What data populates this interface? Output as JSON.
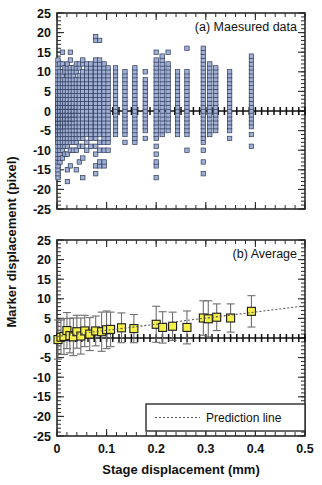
{
  "figure": {
    "axis_labels": {
      "y": "Marker displacement (pixel)",
      "x": "Stage displacement (mm)"
    }
  },
  "chart_data": [
    {
      "type": "scatter",
      "title": "(a) Maesured data",
      "panel": "a",
      "xlabel": "Stage displacement (mm)",
      "ylabel": "Marker displacement (pixel)",
      "xlim": [
        0,
        0.5
      ],
      "ylim": [
        -25,
        25
      ],
      "xticks": [
        0,
        0.1,
        0.2,
        0.3,
        0.4,
        0.5
      ],
      "xticklabels": [
        "0",
        "0.1",
        "0.2",
        "0.3",
        "0.4",
        "0.5"
      ],
      "yticks": [
        -25,
        -20,
        -15,
        -10,
        -5,
        0,
        5,
        10,
        15,
        20,
        25
      ],
      "yticklabels": [
        "-25",
        "-20",
        "-15",
        "-10",
        "-5",
        "0",
        "5",
        "10",
        "15",
        "20",
        "25"
      ],
      "grid": false,
      "legend": null,
      "marker_color": "#9fb0d4",
      "marker_edge_color": "#2e3a5c",
      "columns": [
        {
          "x": 0.002,
          "y": [
            -17,
            -16,
            -15,
            -14,
            -13,
            -12,
            -11,
            -10,
            -9,
            -8,
            -8,
            -7,
            -7,
            -6,
            -6,
            -5,
            -5,
            -5,
            -4,
            -4,
            -4,
            -3,
            -3,
            -3,
            -2,
            -2,
            -2,
            -1,
            -1,
            -1,
            0,
            0,
            0,
            0,
            1,
            1,
            1,
            2,
            2,
            2,
            3,
            3,
            3,
            4,
            4,
            5,
            5,
            6,
            7,
            8,
            9,
            10,
            11,
            12,
            13
          ]
        },
        {
          "x": 0.006,
          "y": [
            -13,
            -12,
            -11,
            -10,
            -9,
            -8,
            -7,
            -6,
            -6,
            -5,
            -5,
            -4,
            -4,
            -3,
            -3,
            -2,
            -2,
            -2,
            -1,
            -1,
            -1,
            0,
            0,
            0,
            1,
            1,
            1,
            2,
            2,
            3,
            3,
            4,
            4,
            5,
            5,
            6,
            7,
            8,
            9,
            10,
            12
          ]
        },
        {
          "x": 0.011,
          "y": [
            -12,
            -10,
            -9,
            -8,
            -7,
            -6,
            -5,
            -5,
            -4,
            -4,
            -3,
            -3,
            -2,
            -2,
            -1,
            -1,
            0,
            0,
            0,
            1,
            1,
            2,
            2,
            3,
            3,
            4,
            5,
            6,
            7,
            8,
            9,
            10,
            12,
            15
          ]
        },
        {
          "x": 0.016,
          "y": [
            -11,
            -9,
            -8,
            -7,
            -6,
            -5,
            -4,
            -4,
            -3,
            -3,
            -2,
            -2,
            -1,
            -1,
            0,
            0,
            1,
            1,
            2,
            2,
            3,
            4,
            5,
            6,
            7,
            8,
            10,
            11
          ]
        },
        {
          "x": 0.021,
          "y": [
            -18,
            -15,
            -11,
            -9,
            -8,
            -7,
            -6,
            -5,
            -4,
            -3,
            -3,
            -2,
            -2,
            -1,
            -1,
            0,
            0,
            1,
            1,
            2,
            2,
            3,
            4,
            5,
            6,
            7,
            8,
            9,
            10,
            11,
            12
          ]
        },
        {
          "x": 0.027,
          "y": [
            -14,
            -10,
            -8,
            -7,
            -6,
            -5,
            -4,
            -3,
            -3,
            -2,
            -2,
            -1,
            -1,
            0,
            0,
            1,
            1,
            2,
            2,
            3,
            4,
            5,
            6,
            7,
            8,
            9,
            10,
            11,
            13,
            15
          ]
        },
        {
          "x": 0.033,
          "y": [
            -10,
            -8,
            -7,
            -6,
            -5,
            -4,
            -3,
            -2,
            -2,
            -1,
            -1,
            0,
            0,
            1,
            1,
            2,
            3,
            4,
            5,
            6,
            7,
            8,
            9,
            10,
            11
          ]
        },
        {
          "x": 0.039,
          "y": [
            -15,
            -10,
            -8,
            -7,
            -6,
            -5,
            -4,
            -3,
            -2,
            -1,
            -1,
            0,
            0,
            1,
            1,
            2,
            3,
            4,
            5,
            6,
            7,
            8,
            10,
            11,
            12
          ]
        },
        {
          "x": 0.045,
          "y": [
            -13,
            -9,
            -7,
            -6,
            -5,
            -4,
            -3,
            -2,
            -1,
            0,
            0,
            1,
            2,
            3,
            4,
            5,
            6,
            7,
            8,
            9,
            11,
            12
          ]
        },
        {
          "x": 0.052,
          "y": [
            -17,
            -12,
            -9,
            -7,
            -6,
            -5,
            -4,
            -3,
            -2,
            -1,
            0,
            1,
            2,
            3,
            4,
            5,
            6,
            7,
            8,
            9,
            10,
            12,
            13
          ]
        },
        {
          "x": 0.06,
          "y": [
            -10,
            -8,
            -6,
            -5,
            -4,
            -3,
            -2,
            -1,
            0,
            1,
            2,
            3,
            4,
            5,
            6,
            7,
            8,
            9,
            10,
            11,
            12
          ]
        },
        {
          "x": 0.068,
          "y": [
            -9,
            -7,
            -6,
            -5,
            -4,
            -3,
            -2,
            -1,
            0,
            1,
            2,
            3,
            4,
            5,
            6,
            7,
            8,
            9,
            10,
            11,
            12
          ]
        },
        {
          "x": 0.078,
          "y": [
            -16,
            -14,
            -11,
            -9,
            -7,
            -6,
            -5,
            -4,
            -3,
            -2,
            -1,
            0,
            1,
            2,
            3,
            4,
            5,
            6,
            7,
            8,
            9,
            10,
            11,
            12,
            13,
            18,
            19
          ]
        },
        {
          "x": 0.086,
          "y": [
            -14,
            -13,
            -10,
            -8,
            -6,
            -5,
            -4,
            -3,
            -2,
            -1,
            0,
            1,
            2,
            3,
            4,
            5,
            6,
            7,
            8,
            9,
            10,
            11,
            12,
            13,
            18
          ]
        },
        {
          "x": 0.095,
          "y": [
            -14,
            -13,
            -10,
            -8,
            -7,
            -6,
            -5,
            -4,
            -3,
            -2,
            -1,
            0,
            1,
            2,
            3,
            4,
            5,
            6,
            7,
            8,
            9,
            10,
            11,
            12
          ]
        },
        {
          "x": 0.103,
          "y": [
            -10,
            -8,
            -7,
            -6,
            -5,
            -4,
            -3,
            -2,
            -1,
            0,
            1,
            2,
            3,
            4,
            5,
            6,
            7,
            8,
            9,
            10,
            11
          ]
        },
        {
          "x": 0.118,
          "y": [
            -6,
            -5,
            -4,
            -3,
            -2,
            -1,
            0,
            1,
            2,
            3,
            4,
            5,
            6,
            7,
            8,
            9,
            10,
            11
          ]
        },
        {
          "x": 0.137,
          "y": [
            -8,
            -6,
            -5,
            -4,
            -3,
            -2,
            -1,
            0,
            1,
            2,
            3,
            4,
            5,
            6,
            7,
            8,
            9,
            10
          ]
        },
        {
          "x": 0.157,
          "y": [
            -8,
            -7,
            -6,
            -5,
            -4,
            -3,
            -2,
            -1,
            0,
            1,
            2,
            3,
            4,
            5,
            6,
            7,
            8,
            9,
            10,
            11
          ]
        },
        {
          "x": 0.178,
          "y": [
            -7,
            -5,
            -4,
            -3,
            -2,
            -1,
            0,
            1,
            2,
            3,
            4,
            5,
            6,
            7,
            8,
            10
          ]
        },
        {
          "x": 0.2,
          "y": [
            -17,
            -14,
            -13,
            -11,
            -9,
            -7,
            -6,
            -5,
            -4,
            -3,
            -2,
            -1,
            0,
            1,
            2,
            3,
            4,
            5,
            6,
            7,
            8,
            9,
            10,
            11,
            12,
            13,
            15
          ]
        },
        {
          "x": 0.212,
          "y": [
            -6,
            -5,
            -4,
            -3,
            -2,
            -1,
            0,
            1,
            2,
            3,
            4,
            5,
            6,
            7,
            8,
            9,
            10,
            11,
            12,
            13,
            14
          ]
        },
        {
          "x": 0.224,
          "y": [
            -5,
            -4,
            -3,
            -2,
            -1,
            0,
            1,
            2,
            3,
            4,
            5,
            6,
            7,
            8,
            9,
            10,
            11,
            12,
            15
          ]
        },
        {
          "x": 0.243,
          "y": [
            -6,
            -5,
            -4,
            -3,
            -2,
            -1,
            0,
            1,
            2,
            3,
            4,
            5,
            6,
            7,
            8,
            9,
            10
          ]
        },
        {
          "x": 0.262,
          "y": [
            -10,
            -6,
            -5,
            -4,
            -3,
            -2,
            -1,
            0,
            1,
            2,
            3,
            4,
            5,
            6,
            7,
            8,
            9,
            10,
            16
          ]
        },
        {
          "x": 0.295,
          "y": [
            -16,
            -13,
            -10,
            -8,
            -7,
            -6,
            -5,
            -4,
            -3,
            -2,
            -1,
            0,
            1,
            2,
            3,
            4,
            5,
            6,
            7,
            8,
            9,
            10,
            11,
            12,
            13,
            14,
            15,
            16
          ]
        },
        {
          "x": 0.308,
          "y": [
            -6,
            -5,
            -4,
            -3,
            -2,
            -1,
            0,
            1,
            2,
            3,
            4,
            5,
            6,
            7,
            8,
            9,
            10,
            11,
            12
          ]
        },
        {
          "x": 0.32,
          "y": [
            -5,
            -4,
            -3,
            -2,
            -1,
            0,
            1,
            2,
            3,
            4,
            5,
            6,
            7,
            8,
            9,
            10,
            11
          ]
        },
        {
          "x": 0.348,
          "y": [
            -7,
            -5,
            -4,
            -3,
            -2,
            -1,
            0,
            1,
            2,
            3,
            4,
            5,
            6,
            7,
            8,
            9,
            10
          ]
        },
        {
          "x": 0.392,
          "y": [
            -9,
            -6,
            -4,
            -3,
            -2,
            -1,
            0,
            1,
            2,
            3,
            4,
            5,
            6,
            7,
            8,
            9,
            10,
            11,
            12,
            13,
            14
          ]
        }
      ]
    },
    {
      "type": "scatter",
      "title": "(b) Average",
      "panel": "b",
      "xlabel": "Stage displacement (mm)",
      "ylabel": "Marker displacement (pixel)",
      "xlim": [
        0,
        0.5
      ],
      "ylim": [
        -25,
        25
      ],
      "xticks": [
        0,
        0.1,
        0.2,
        0.3,
        0.4,
        0.5
      ],
      "xticklabels": [
        "0",
        "0.1",
        "0.2",
        "0.3",
        "0.4",
        "0.5"
      ],
      "yticks": [
        -25,
        -20,
        -15,
        -10,
        -5,
        0,
        5,
        10,
        15,
        20,
        25
      ],
      "yticklabels": [
        "-25",
        "-20",
        "-15",
        "-10",
        "-5",
        "0",
        "5",
        "10",
        "15",
        "20",
        "25"
      ],
      "grid": false,
      "marker_color": "#f5ef4a",
      "marker_edge_color": "#1a1a1a",
      "errorbar_color": "#6e6e6e",
      "legend": {
        "position": "bottom-right",
        "entries": [
          {
            "label": "Prediction line",
            "style": "dotted"
          }
        ]
      },
      "series": [
        {
          "name": "Average",
          "points": [
            {
              "x": 0.002,
              "y": -0.4,
              "err": 5.0
            },
            {
              "x": 0.008,
              "y": 0.2,
              "err": 4.4
            },
            {
              "x": 0.014,
              "y": 0.4,
              "err": 4.6
            },
            {
              "x": 0.02,
              "y": 1.9,
              "err": 4.6
            },
            {
              "x": 0.026,
              "y": 0.6,
              "err": 4.4
            },
            {
              "x": 0.033,
              "y": 0.3,
              "err": 4.8
            },
            {
              "x": 0.04,
              "y": 1.6,
              "err": 4.2
            },
            {
              "x": 0.048,
              "y": 0.5,
              "err": 4.6
            },
            {
              "x": 0.056,
              "y": 1.8,
              "err": 4.0
            },
            {
              "x": 0.066,
              "y": 1.0,
              "err": 4.2
            },
            {
              "x": 0.078,
              "y": 1.8,
              "err": 3.8
            },
            {
              "x": 0.09,
              "y": 1.6,
              "err": 5.0
            },
            {
              "x": 0.1,
              "y": 2.1,
              "err": 4.8
            },
            {
              "x": 0.108,
              "y": 2.2,
              "err": 4.4
            },
            {
              "x": 0.13,
              "y": 2.6,
              "err": 3.8
            },
            {
              "x": 0.155,
              "y": 2.4,
              "err": 3.6
            },
            {
              "x": 0.2,
              "y": 3.5,
              "err": 4.6
            },
            {
              "x": 0.213,
              "y": 2.7,
              "err": 4.0
            },
            {
              "x": 0.233,
              "y": 3.0,
              "err": 3.6
            },
            {
              "x": 0.262,
              "y": 2.7,
              "err": 4.2
            },
            {
              "x": 0.295,
              "y": 5.1,
              "err": 4.4
            },
            {
              "x": 0.305,
              "y": 4.9,
              "err": 4.6
            },
            {
              "x": 0.322,
              "y": 5.3,
              "err": 3.4
            },
            {
              "x": 0.35,
              "y": 5.1,
              "err": 3.6
            },
            {
              "x": 0.392,
              "y": 6.8,
              "err": 4.0
            }
          ]
        },
        {
          "name": "Prediction line",
          "style": "dotted",
          "x": [
            0.0,
            0.5
          ],
          "y": [
            0.4,
            8.2
          ]
        }
      ]
    }
  ]
}
